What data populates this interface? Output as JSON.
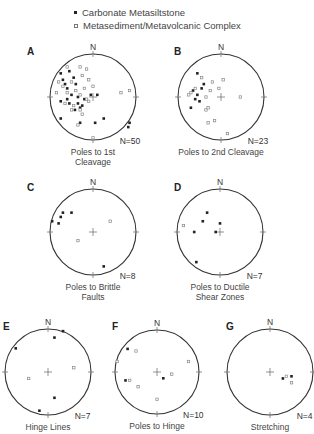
{
  "legend": {
    "solid": "Carbonate Metasiltstone",
    "open": "Metasediment/Metavolcanic Complex"
  },
  "north_label": "N",
  "stereonets": [
    {
      "id": "A",
      "label": "A",
      "n_label": "N=50",
      "caption": [
        "Poles to 1st",
        "Cleavage"
      ],
      "solid": [
        [
          -0.75,
          -0.55
        ],
        [
          -0.55,
          -0.6
        ],
        [
          -0.7,
          -0.4
        ],
        [
          -0.4,
          -0.3
        ],
        [
          -0.6,
          -0.2
        ],
        [
          -0.5,
          -0.05
        ],
        [
          -0.75,
          0.1
        ],
        [
          -0.55,
          0.15
        ],
        [
          -0.35,
          0.0
        ],
        [
          -0.2,
          0.05
        ],
        [
          -0.05,
          -0.05
        ],
        [
          0.1,
          -0.05
        ],
        [
          -0.42,
          0.3
        ],
        [
          -0.3,
          0.25
        ],
        [
          -0.75,
          0.5
        ],
        [
          -0.3,
          0.6
        ],
        [
          0.05,
          0.6
        ],
        [
          0.25,
          0.5
        ],
        [
          0.85,
          0.6
        ],
        [
          0.82,
          0.7
        ],
        [
          -0.65,
          -0.3
        ],
        [
          -0.45,
          -0.45
        ],
        [
          -0.25,
          0.2
        ],
        [
          -0.6,
          0.05
        ],
        [
          -0.35,
          0.15
        ]
      ],
      "open": [
        [
          -0.8,
          -0.35
        ],
        [
          -0.6,
          -0.7
        ],
        [
          -0.3,
          -0.7
        ],
        [
          -0.15,
          -0.65
        ],
        [
          -0.25,
          -0.5
        ],
        [
          -0.1,
          -0.4
        ],
        [
          -0.5,
          -0.35
        ],
        [
          -0.7,
          -0.25
        ],
        [
          -0.4,
          -0.15
        ],
        [
          -0.2,
          -0.2
        ],
        [
          -0.85,
          -0.1
        ],
        [
          -0.6,
          -0.1
        ],
        [
          -0.3,
          -0.05
        ],
        [
          0.0,
          -0.25
        ],
        [
          -0.15,
          0.05
        ],
        [
          -0.45,
          0.2
        ],
        [
          -0.3,
          0.3
        ],
        [
          -0.1,
          0.1
        ],
        [
          -0.25,
          0.4
        ],
        [
          -0.35,
          0.65
        ],
        [
          0.65,
          -0.1
        ],
        [
          0.85,
          -0.15
        ],
        [
          0.0,
          0.95
        ],
        [
          -0.5,
          0.3
        ],
        [
          -0.65,
          0.15
        ]
      ]
    },
    {
      "id": "B",
      "label": "B",
      "n_label": "N=23",
      "caption": [
        "Poles to 2nd Cleavage"
      ],
      "solid": [
        [
          -0.55,
          -0.55
        ],
        [
          -0.4,
          -0.3
        ],
        [
          -0.65,
          -0.15
        ],
        [
          -0.55,
          -0.05
        ],
        [
          -0.5,
          0.1
        ],
        [
          -0.7,
          0.25
        ],
        [
          -0.45,
          -0.2
        ],
        [
          -0.6,
          0.05
        ]
      ],
      "open": [
        [
          -0.45,
          -0.45
        ],
        [
          -0.2,
          -0.35
        ],
        [
          0.05,
          -0.4
        ],
        [
          -0.25,
          -0.15
        ],
        [
          -0.05,
          -0.2
        ],
        [
          -0.35,
          0.0
        ],
        [
          -0.7,
          -0.1
        ],
        [
          -0.75,
          -0.05
        ],
        [
          -0.6,
          -0.2
        ],
        [
          -0.35,
          0.3
        ],
        [
          -0.3,
          0.25
        ],
        [
          -0.3,
          0.6
        ],
        [
          -0.15,
          0.55
        ],
        [
          0.45,
          0.0
        ],
        [
          0.15,
          0.85
        ]
      ]
    },
    {
      "id": "C",
      "label": "C",
      "n_label": "N=8",
      "caption": [
        "Poles to Brittle",
        "Faults"
      ],
      "solid": [
        [
          -0.95,
          -0.25
        ],
        [
          -0.8,
          -0.2
        ],
        [
          -0.75,
          -0.35
        ],
        [
          -0.7,
          -0.45
        ],
        [
          -0.5,
          -0.45
        ],
        [
          0.25,
          0.8
        ]
      ],
      "open": [
        [
          0.4,
          -0.25
        ],
        [
          -0.35,
          0.2
        ]
      ]
    },
    {
      "id": "D",
      "label": "D",
      "n_label": "N=7",
      "caption": [
        "Poles to Ductile",
        "Shear Zones"
      ],
      "solid": [
        [
          -0.3,
          -0.45
        ],
        [
          -0.4,
          -0.25
        ],
        [
          0.0,
          -0.2
        ],
        [
          -0.6,
          0.0
        ],
        [
          -0.1,
          0.0
        ],
        [
          -0.55,
          0.7
        ]
      ],
      "open": [
        [
          -0.85,
          -0.15
        ]
      ]
    },
    {
      "id": "E",
      "label": "E",
      "n_label": "N=7",
      "caption": [
        "Hinge Lines"
      ],
      "solid": [
        [
          0.15,
          -0.8
        ],
        [
          0.35,
          -0.95
        ],
        [
          -0.75,
          -0.55
        ],
        [
          0.15,
          0.6
        ],
        [
          -0.2,
          0.9
        ]
      ],
      "open": [
        [
          0.6,
          -0.1
        ],
        [
          -0.45,
          0.15
        ]
      ]
    },
    {
      "id": "F",
      "label": "F",
      "n_label": "N=10",
      "caption": [
        "Poles to Hinge",
        "..."
      ],
      "solid": [
        [
          -0.7,
          -0.55
        ],
        [
          -0.75,
          0.2
        ],
        [
          0.15,
          0.15
        ]
      ],
      "open": [
        [
          -0.5,
          -0.5
        ],
        [
          -0.95,
          -0.25
        ],
        [
          0.75,
          -0.25
        ],
        [
          0.35,
          0.05
        ],
        [
          -0.65,
          0.2
        ],
        [
          -0.45,
          0.35
        ],
        [
          0.0,
          0.65
        ]
      ]
    },
    {
      "id": "G",
      "label": "G",
      "n_label": "N=4",
      "caption": [
        "Stretching",
        "..."
      ],
      "solid": [
        [
          0.3,
          0.15
        ],
        [
          0.5,
          0.1
        ]
      ],
      "open": [
        [
          0.38,
          0.1
        ],
        [
          0.5,
          0.25
        ]
      ]
    }
  ]
}
